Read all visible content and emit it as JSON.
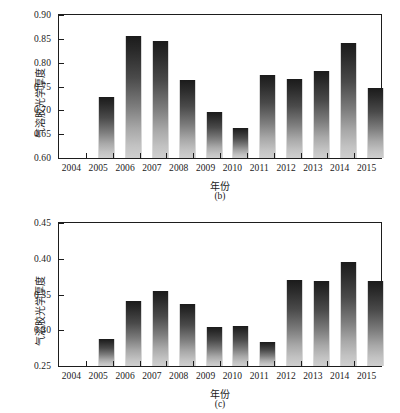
{
  "figure": {
    "panels": [
      {
        "id": "b",
        "caption": "(b)",
        "ytitle": "气溶胶光学厚度",
        "xtitle": "年份"
      },
      {
        "id": "c",
        "caption": "(c)",
        "ytitle": "气溶胶光学厚度",
        "xtitle": "年份"
      }
    ]
  },
  "chart_data": [
    {
      "type": "bar",
      "title": "(b)",
      "xlabel": "年份",
      "ylabel": "气溶胶光学厚度",
      "categories": [
        "2004",
        "2005",
        "2006",
        "2007",
        "2008",
        "2009",
        "2010",
        "2011",
        "2012",
        "2013",
        "2014",
        "2015"
      ],
      "values": [
        null,
        0.728,
        0.855,
        0.846,
        0.763,
        0.697,
        0.662,
        0.774,
        0.766,
        0.782,
        0.841,
        0.747
      ],
      "ylim": [
        0.6,
        0.9
      ],
      "yticks": [
        "0.60",
        "0.65",
        "0.70",
        "0.75",
        "0.80",
        "0.85",
        "0.90"
      ],
      "ytick_values": [
        0.6,
        0.65,
        0.7,
        0.75,
        0.8,
        0.85,
        0.9
      ],
      "grid": false,
      "legend": null,
      "bar_color_top": "#1b1b1b",
      "bar_color_bottom": "#cfcfcf"
    },
    {
      "type": "bar",
      "title": "(c)",
      "xlabel": "年份",
      "ylabel": "气溶胶光学厚度",
      "categories": [
        "2004",
        "2005",
        "2006",
        "2007",
        "2008",
        "2009",
        "2010",
        "2011",
        "2012",
        "2013",
        "2014",
        "2015"
      ],
      "values": [
        null,
        0.288,
        0.341,
        0.355,
        0.337,
        0.304,
        0.306,
        0.284,
        0.371,
        0.369,
        0.395,
        0.369
      ],
      "ylim": [
        0.25,
        0.45
      ],
      "yticks": [
        "0.25",
        "0.30",
        "0.35",
        "0.40",
        "0.45"
      ],
      "ytick_values": [
        0.25,
        0.3,
        0.35,
        0.4,
        0.45
      ],
      "grid": false,
      "legend": null,
      "bar_color_top": "#1b1b1b",
      "bar_color_bottom": "#cfcfcf"
    }
  ]
}
